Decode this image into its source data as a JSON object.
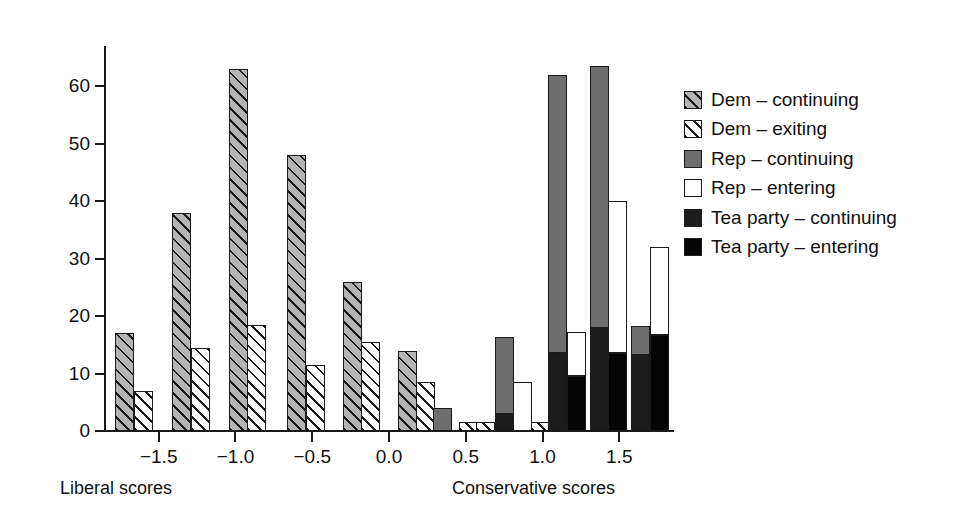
{
  "chart_data": {
    "type": "bar",
    "title": "",
    "subtitle": "",
    "xlabel_left": "Liberal scores",
    "xlabel_right": "Conservative scores",
    "ylabel": "",
    "xlim": [
      -1.85,
      1.85
    ],
    "ylim": [
      0,
      67
    ],
    "grid": false,
    "legend_position": "right",
    "x_ticks": [
      "−1.5",
      "−1.0",
      "−0.5",
      "0.0",
      "0.5",
      "1.0",
      "1.5"
    ],
    "x_tick_values": [
      -1.5,
      -1.0,
      -0.5,
      0.0,
      0.5,
      1.0,
      1.5
    ],
    "y_ticks": [
      "0",
      "10",
      "20",
      "30",
      "40",
      "50",
      "60"
    ],
    "y_tick_values": [
      0,
      10,
      20,
      30,
      40,
      50,
      60
    ],
    "series": [
      {
        "name": "Dem – continuing",
        "key": "dem-cont",
        "color": "#b4b4b4",
        "pattern": "diagonal-hatch"
      },
      {
        "name": "Dem – exiting",
        "key": "dem-exit",
        "color": "#ffffff",
        "pattern": "diagonal-hatch"
      },
      {
        "name": "Rep – continuing",
        "key": "rep-cont",
        "color": "#6e6e6e",
        "pattern": "solid"
      },
      {
        "name": "Rep – entering",
        "key": "rep-ent",
        "color": "#ffffff",
        "pattern": "solid"
      },
      {
        "name": "Tea party – continuing",
        "key": "tea-cont",
        "color": "#1c1c1c",
        "pattern": "solid"
      },
      {
        "name": "Tea party – entering",
        "key": "tea-ent",
        "color": "#050505",
        "pattern": "solid"
      }
    ],
    "bars": [
      {
        "id": "b1",
        "x": -1.72,
        "series": "dem-cont",
        "value": 17.0,
        "base": 0
      },
      {
        "id": "b2",
        "x": -1.6,
        "series": "dem-exit",
        "value": 7.0,
        "base": 0
      },
      {
        "id": "b3",
        "x": -1.35,
        "series": "dem-cont",
        "value": 38.0,
        "base": 0
      },
      {
        "id": "b4",
        "x": -1.23,
        "series": "dem-exit",
        "value": 14.5,
        "base": 0
      },
      {
        "id": "b5",
        "x": -0.98,
        "series": "dem-cont",
        "value": 63.0,
        "base": 0
      },
      {
        "id": "b6",
        "x": -0.86,
        "series": "dem-exit",
        "value": 18.5,
        "base": 0
      },
      {
        "id": "b7",
        "x": -0.6,
        "series": "dem-cont",
        "value": 48.0,
        "base": 0
      },
      {
        "id": "b8",
        "x": -0.48,
        "series": "dem-exit",
        "value": 11.5,
        "base": 0
      },
      {
        "id": "b9",
        "x": -0.24,
        "series": "dem-cont",
        "value": 26.0,
        "base": 0
      },
      {
        "id": "b10",
        "x": -0.12,
        "series": "dem-exit",
        "value": 15.5,
        "base": 0
      },
      {
        "id": "b11",
        "x": 0.12,
        "series": "dem-cont",
        "value": 14.0,
        "base": 0
      },
      {
        "id": "b12",
        "x": 0.24,
        "series": "dem-exit",
        "value": 8.5,
        "base": 0
      },
      {
        "id": "b13",
        "x": 0.35,
        "series": "rep-cont",
        "value": 4.0,
        "base": 0
      },
      {
        "id": "b14",
        "x": 0.52,
        "series": "dem-exit",
        "value": 1.5,
        "base": 0
      },
      {
        "id": "b15",
        "x": 0.63,
        "series": "dem-exit",
        "value": 1.5,
        "base": 0
      },
      {
        "id": "b16",
        "x": 0.75,
        "series": "tea-cont",
        "value": 3.0,
        "base": 0
      },
      {
        "id": "b17",
        "x": 0.75,
        "series": "rep-cont",
        "value": 16.3,
        "base": 3.0
      },
      {
        "id": "b18",
        "x": 0.87,
        "series": "rep-ent",
        "value": 8.5,
        "base": 0
      },
      {
        "id": "b19",
        "x": 0.99,
        "series": "dem-exit",
        "value": 1.5,
        "base": 0
      },
      {
        "id": "b20",
        "x": 1.1,
        "series": "tea-cont",
        "value": 13.5,
        "base": 0
      },
      {
        "id": "b21",
        "x": 1.1,
        "series": "rep-cont",
        "value": 62.0,
        "base": 13.5
      },
      {
        "id": "b22",
        "x": 1.22,
        "series": "tea-ent",
        "value": 9.5,
        "base": 0
      },
      {
        "id": "b23",
        "x": 1.22,
        "series": "rep-ent",
        "value": 17.2,
        "base": 9.5
      },
      {
        "id": "b24",
        "x": 1.37,
        "series": "tea-cont",
        "value": 18.0,
        "base": 0
      },
      {
        "id": "b25",
        "x": 1.37,
        "series": "rep-cont",
        "value": 63.5,
        "base": 18.0
      },
      {
        "id": "b26",
        "x": 1.49,
        "series": "tea-ent",
        "value": 13.5,
        "base": 0
      },
      {
        "id": "b27",
        "x": 1.49,
        "series": "rep-ent",
        "value": 40.0,
        "base": 13.5
      },
      {
        "id": "b28",
        "x": 1.64,
        "series": "tea-cont",
        "value": 13.3,
        "base": 0
      },
      {
        "id": "b29",
        "x": 1.64,
        "series": "rep-cont",
        "value": 18.2,
        "base": 13.3
      },
      {
        "id": "b30",
        "x": 1.76,
        "series": "tea-ent",
        "value": 16.7,
        "base": 0
      },
      {
        "id": "b31",
        "x": 1.76,
        "series": "rep-ent",
        "value": 32.0,
        "base": 16.7
      }
    ]
  },
  "legend": {
    "items": [
      {
        "label": "Dem – continuing",
        "key": "dem-cont"
      },
      {
        "label": "Dem – exiting",
        "key": "dem-exit"
      },
      {
        "label": "Rep – continuing",
        "key": "rep-cont"
      },
      {
        "label": "Rep – entering",
        "key": "rep-ent"
      },
      {
        "label": "Tea party – continuing",
        "key": "tea-cont"
      },
      {
        "label": "Tea party – entering",
        "key": "tea-ent"
      }
    ]
  }
}
